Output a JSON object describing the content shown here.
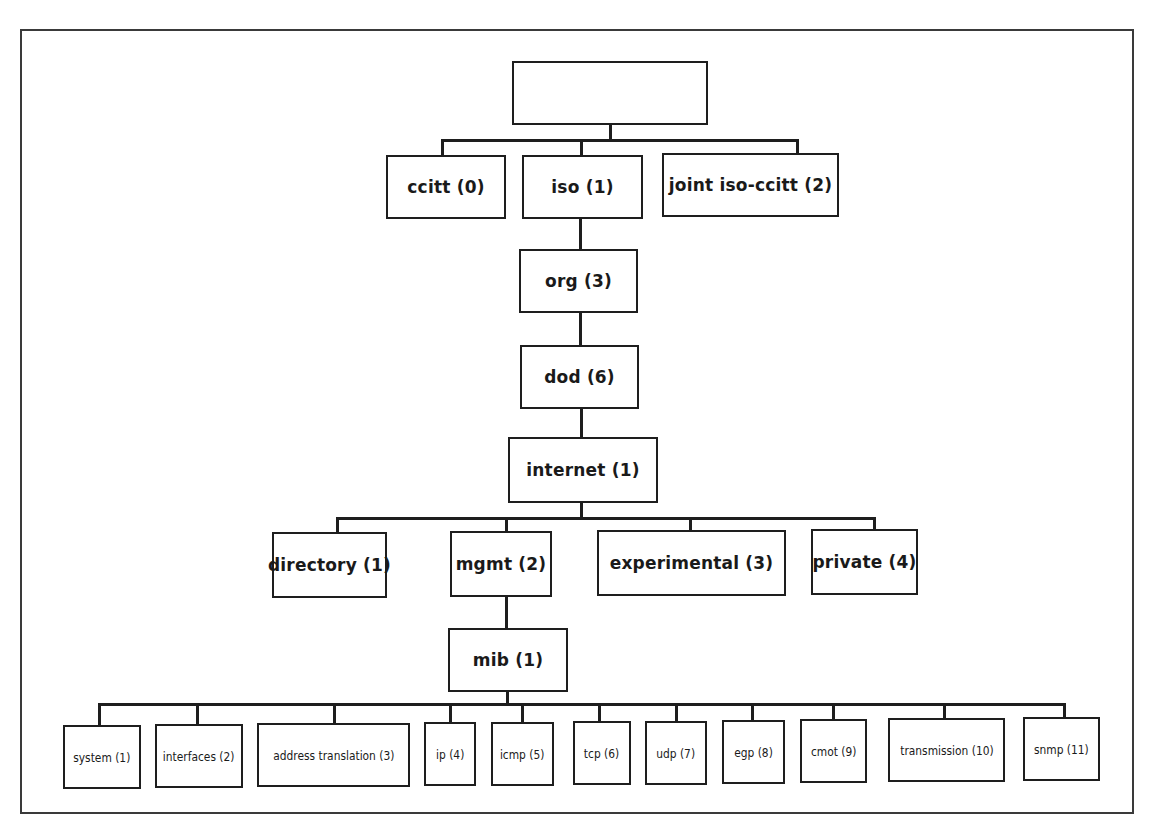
{
  "diagram": {
    "type": "tree",
    "root": {
      "label": ""
    },
    "level1": [
      {
        "label": "ccitt (0)"
      },
      {
        "label": "iso (1)"
      },
      {
        "label": "joint iso-ccitt (2)"
      }
    ],
    "chain": [
      {
        "label": "org (3)",
        "parent": "iso (1)"
      },
      {
        "label": "dod (6)",
        "parent": "org (3)"
      },
      {
        "label": "internet (1)",
        "parent": "dod (6)"
      }
    ],
    "internet_children": [
      {
        "label": "directory (1)"
      },
      {
        "label": "mgmt (2)"
      },
      {
        "label": "experimental (3)"
      },
      {
        "label": "private (4)"
      }
    ],
    "mgmt_child": {
      "label": "mib (1)",
      "parent": "mgmt (2)"
    },
    "mib_children": [
      {
        "label": "system (1)"
      },
      {
        "label": "interfaces (2)"
      },
      {
        "label": "address translation (3)"
      },
      {
        "label": "ip (4)"
      },
      {
        "label": "icmp (5)"
      },
      {
        "label": "tcp (6)"
      },
      {
        "label": "udp (7)"
      },
      {
        "label": "egp (8)"
      },
      {
        "label": "cmot (9)"
      },
      {
        "label": "transmission (10)"
      },
      {
        "label": "snmp (11)"
      }
    ]
  },
  "colors": {
    "line": "#1e1e1e",
    "frame": "#3a3a3a",
    "background": "#ffffff"
  }
}
